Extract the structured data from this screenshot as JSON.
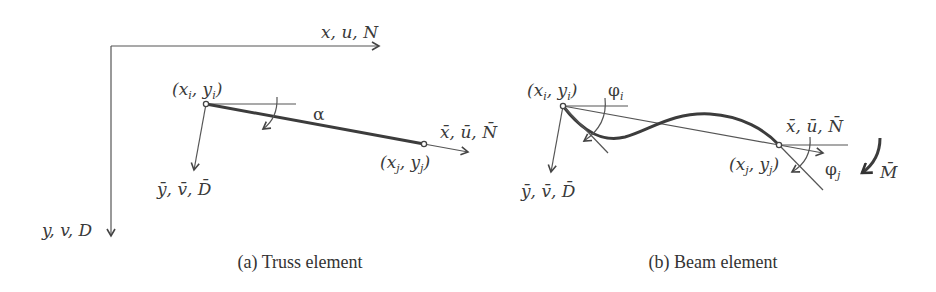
{
  "figure": {
    "panels": [
      {
        "id": "a",
        "caption": "(a) Truss element",
        "global_axes": {
          "x_label": "x, u, N",
          "y_label": "y, v, D"
        },
        "node_i_label": {
          "base": "(x",
          "sub": "i",
          "mid": ", y",
          "sub2": "i",
          "end": ")"
        },
        "node_j_label": {
          "base": "(x",
          "sub": "j",
          "mid": ", y",
          "sub2": "j",
          "end": ")"
        },
        "local_x_label": "x̄, ū, N̄",
        "local_y_label": "ȳ, v̄, D̄",
        "angle_label": "α"
      },
      {
        "id": "b",
        "caption": "(b) Beam element",
        "node_i_label": {
          "base": "(x",
          "sub": "i",
          "mid": ", y",
          "sub2": "i",
          "end": ")"
        },
        "node_j_label": {
          "base": "(x",
          "sub": "j",
          "mid": ", y",
          "sub2": "j",
          "end": ")"
        },
        "local_x_label": "x̄, ū, N̄",
        "local_y_label": "ȳ, v̄, D̄",
        "rotation_i_label": {
          "base": "φ",
          "sub": "i"
        },
        "rotation_j_label": {
          "base": "φ",
          "sub": "j"
        },
        "moment_label": "M̄"
      }
    ]
  }
}
